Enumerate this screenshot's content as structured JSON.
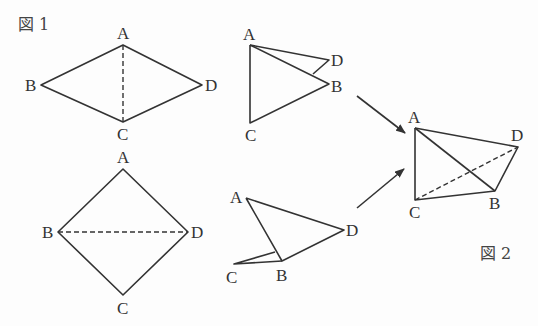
{
  "figure1": {
    "label": "図 1",
    "rhombus": {
      "vertices": {
        "A": [
          123,
          45
        ],
        "B": [
          41,
          85
        ],
        "C": [
          123,
          122
        ],
        "D": [
          202,
          85
        ]
      },
      "labels": {
        "A": "A",
        "B": "B",
        "C": "C",
        "D": "D"
      },
      "dashed_diagonal": "AC"
    },
    "square": {
      "vertices": {
        "A": [
          123,
          169
        ],
        "B": [
          58,
          232
        ],
        "C": [
          123,
          295
        ],
        "D": [
          188,
          232
        ]
      },
      "labels": {
        "A": "A",
        "B": "B",
        "C": "C",
        "D": "D"
      },
      "dashed_diagonal": "BD"
    }
  },
  "folded_pieces": {
    "upper": {
      "labels": {
        "A": "A",
        "B": "B",
        "C": "C",
        "D": "D"
      }
    },
    "lower": {
      "labels": {
        "A": "A",
        "B": "B",
        "C": "C",
        "D": "D"
      }
    }
  },
  "figure2": {
    "label": "図 2",
    "tetrahedron": {
      "labels": {
        "A": "A",
        "B": "B",
        "C": "C",
        "D": "D"
      },
      "dashed_edge": "CD"
    }
  }
}
